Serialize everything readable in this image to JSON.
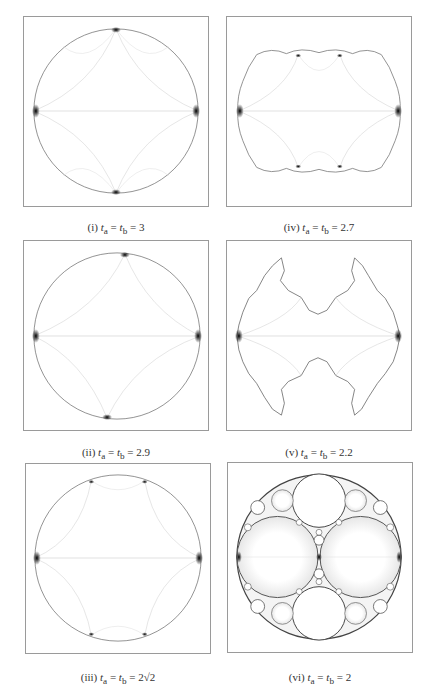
{
  "figure": {
    "panels": [
      {
        "id": "i",
        "label": "(i)",
        "expr": "t_a = t_b = 3",
        "ta": "3",
        "shape": "disk"
      },
      {
        "id": "ii",
        "label": "(ii)",
        "expr": "t_a = t_b = 2.9",
        "ta": "2.9",
        "shape": "disk"
      },
      {
        "id": "iii",
        "label": "(iii)",
        "expr": "t_a = t_b = 2√2",
        "ta": "2√2",
        "shape": "disk"
      },
      {
        "id": "iv",
        "label": "(iv)",
        "expr": "t_a = t_b = 2.7",
        "ta": "2.7",
        "shape": "quasi-circle"
      },
      {
        "id": "v",
        "label": "(v)",
        "expr": "t_a = t_b = 2.2",
        "ta": "2.2",
        "shape": "fractal"
      },
      {
        "id": "vi",
        "label": "(vi)",
        "expr": "t_a = t_b = 2",
        "ta": "2",
        "shape": "apollonian-gasket"
      }
    ],
    "captions": {
      "i": {
        "num": "(i)",
        "eq": "= t",
        "val": "= 3"
      },
      "ii": {
        "num": "(ii)",
        "val": "= 2.9"
      },
      "iii": {
        "num": "(iii)",
        "val": "= 2√2"
      },
      "iv": {
        "num": "(iv)",
        "val": "= 2.7"
      },
      "v": {
        "num": "(v)",
        "val": "= 2.2"
      },
      "vi": {
        "num": "(vi)",
        "val": "= 2"
      }
    },
    "var_a": "t",
    "sub_a": "a",
    "sub_b": "b",
    "colors": {
      "stroke": "#9a9a9a",
      "curve": "#cfcfcf",
      "dark": "#111111"
    }
  }
}
